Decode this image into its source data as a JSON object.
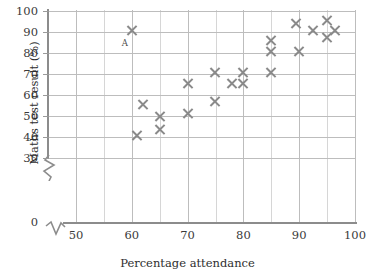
{
  "chart_data": {
    "type": "scatter",
    "title": "",
    "xlabel": "Percentage attendance",
    "ylabel": "Maths test result (%)",
    "xlim": [
      45,
      100
    ],
    "ylim": [
      0,
      100
    ],
    "y_axis_break": true,
    "y_break_range": [
      0,
      30
    ],
    "x_axis_break": true,
    "grid": true,
    "legend": null,
    "xticks": [
      50,
      60,
      70,
      80,
      90,
      100
    ],
    "xtick_labels": [
      "50",
      "60",
      "70",
      "80",
      "90",
      "100"
    ],
    "x_minor_ticks": [
      55,
      65,
      75,
      85,
      95
    ],
    "yticks": [
      0,
      30,
      40,
      50,
      60,
      70,
      80,
      90,
      100
    ],
    "ytick_labels": [
      "0",
      "30",
      "40",
      "50",
      "60",
      "70",
      "80",
      "90",
      "100"
    ],
    "marker": "x",
    "marker_color": "#8a8a8a",
    "grid_color": "#c9c9c9",
    "points": [
      {
        "x": 60.0,
        "y": 90.5,
        "label": "A"
      },
      {
        "x": 62.0,
        "y": 55.5,
        "label": ""
      },
      {
        "x": 61.0,
        "y": 40.5,
        "label": ""
      },
      {
        "x": 65.0,
        "y": 50.0,
        "label": ""
      },
      {
        "x": 65.0,
        "y": 43.5,
        "label": ""
      },
      {
        "x": 70.0,
        "y": 65.5,
        "label": ""
      },
      {
        "x": 70.0,
        "y": 51.0,
        "label": ""
      },
      {
        "x": 75.0,
        "y": 70.5,
        "label": ""
      },
      {
        "x": 75.0,
        "y": 57.0,
        "label": ""
      },
      {
        "x": 78.0,
        "y": 65.5,
        "label": ""
      },
      {
        "x": 80.0,
        "y": 70.5,
        "label": ""
      },
      {
        "x": 80.0,
        "y": 65.5,
        "label": ""
      },
      {
        "x": 85.0,
        "y": 86.0,
        "label": ""
      },
      {
        "x": 85.0,
        "y": 80.5,
        "label": ""
      },
      {
        "x": 85.0,
        "y": 70.5,
        "label": ""
      },
      {
        "x": 89.5,
        "y": 94.0,
        "label": ""
      },
      {
        "x": 90.0,
        "y": 80.5,
        "label": ""
      },
      {
        "x": 92.5,
        "y": 90.5,
        "label": ""
      },
      {
        "x": 95.0,
        "y": 95.5,
        "label": ""
      },
      {
        "x": 95.0,
        "y": 87.5,
        "label": ""
      },
      {
        "x": 96.5,
        "y": 90.5,
        "label": ""
      }
    ],
    "annotations": [
      {
        "text": "A",
        "x": 58.2,
        "y": 87.0
      }
    ]
  }
}
